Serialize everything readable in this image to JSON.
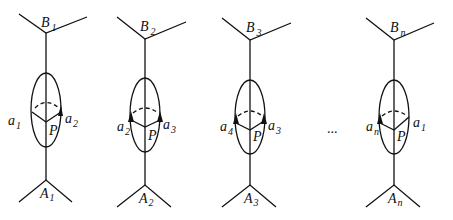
{
  "figures": [
    {
      "top": {
        "letter": "B",
        "sub": "1"
      },
      "bottom": {
        "letter": "A",
        "sub": "1"
      },
      "left": {
        "letter": "a",
        "sub": "1"
      },
      "right": {
        "letter": "a",
        "sub": "2"
      },
      "center": "P",
      "arrow_left": false,
      "arrow_right": true
    },
    {
      "top": {
        "letter": "B",
        "sub": "2"
      },
      "bottom": {
        "letter": "A",
        "sub": "2"
      },
      "left": {
        "letter": "a",
        "sub": "2"
      },
      "right": {
        "letter": "a",
        "sub": "3"
      },
      "center": "P",
      "arrow_left": true,
      "arrow_right": true
    },
    {
      "top": {
        "letter": "B",
        "sub": "3"
      },
      "bottom": {
        "letter": "A",
        "sub": "3"
      },
      "left": {
        "letter": "a",
        "sub": "4"
      },
      "right": {
        "letter": "a",
        "sub": "3"
      },
      "center": "P",
      "arrow_left": true,
      "arrow_right": true
    },
    {
      "top": {
        "letter": "B",
        "sub": "n"
      },
      "bottom": {
        "letter": "A",
        "sub": "n"
      },
      "left": {
        "letter": "a",
        "sub": "n"
      },
      "right": {
        "letter": "a",
        "sub": "1"
      },
      "center": "P",
      "arrow_left": true,
      "arrow_right": false
    }
  ],
  "ellipsis": "..."
}
